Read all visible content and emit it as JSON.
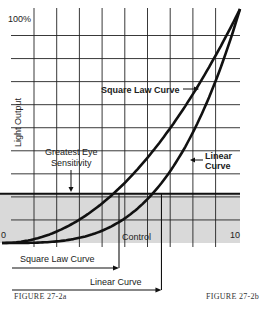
{
  "chart_data": {
    "type": "line",
    "title": "",
    "xlabel": "Control",
    "ylabel": "Light Output",
    "x_tick_labels": [
      "0",
      "10"
    ],
    "y_tick_labels": [
      "100%"
    ],
    "xlim": [
      0,
      10
    ],
    "ylim": [
      0,
      100
    ],
    "grid": true,
    "grid_divisions_x": 10,
    "grid_divisions_y": 10,
    "series": [
      {
        "name": "Square Law Curve",
        "x": [
          0,
          1,
          2,
          3,
          4,
          5,
          6,
          7,
          8,
          9,
          10
        ],
        "y": [
          0,
          1,
          4,
          9,
          16,
          25,
          36,
          49,
          64,
          81,
          100
        ]
      },
      {
        "name": "Linear Curve",
        "x": [
          0,
          1,
          2,
          3,
          4,
          5,
          6,
          7,
          8,
          9,
          10
        ],
        "y": [
          0,
          0.4,
          1.6,
          3.8,
          7.4,
          12.8,
          20.5,
          31,
          45.5,
          66,
          100
        ]
      }
    ],
    "shaded_band": {
      "label": "Greatest Eye Sensitivity",
      "y_range": [
        0,
        21
      ]
    },
    "annotations": [
      {
        "text": "Square Law Curve",
        "points_to": "Square Law Curve"
      },
      {
        "text": "Linear Curve",
        "points_to": "Linear Curve"
      },
      {
        "text": "Greatest Eye Sensitivity",
        "points_to": "shaded band top edge"
      }
    ],
    "bottom_arrows": [
      {
        "label": "Square Law Curve",
        "control_at_threshold": 5.0
      },
      {
        "label": "Linear Curve",
        "control_at_threshold": 6.7
      }
    ]
  },
  "labels": {
    "y_top": "100%",
    "y_axis": "Light Output",
    "x_zero": "0",
    "x_ten": "10",
    "x_axis": "Control",
    "square_law": "Square Law Curve",
    "linear_1": "Linear",
    "linear_2": "Curve",
    "eye_1": "Greatest Eye",
    "eye_2": "Sensitivity",
    "arrow_square": "Square Law Curve",
    "arrow_linear": "Linear Curve",
    "figure_a": "FIGURE  27-2a",
    "figure_b": "FIGURE  27-2b"
  },
  "colors": {
    "ink": "#111111",
    "band": "#d9d9d9",
    "grid": "#222222"
  }
}
